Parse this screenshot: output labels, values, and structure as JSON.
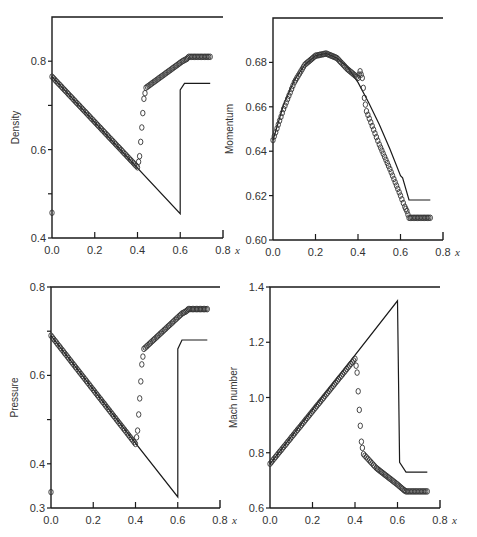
{
  "chart_data": [
    {
      "id": "density",
      "type": "line",
      "title": "",
      "xlabel": "x",
      "ylabel": "Density",
      "xlim": [
        0.0,
        0.8
      ],
      "ylim": [
        0.4,
        0.9
      ],
      "xticks": [
        "0.0",
        "0.2",
        "0.4",
        "0.6",
        "0.8"
      ],
      "yticks": [
        {
          "v": 0.4,
          "label": "0.4"
        },
        {
          "v": 0.5,
          "label": ""
        },
        {
          "v": 0.6,
          "label": "0.6"
        },
        {
          "v": 0.7,
          "label": ""
        },
        {
          "v": 0.8,
          "label": "0.8"
        }
      ],
      "frame": {
        "left": 52,
        "right": 223,
        "top": 17,
        "bottom": 238
      },
      "grid": false,
      "series": [
        {
          "name": "exact",
          "style": "line",
          "x": [
            0.0,
            0.6,
            0.6,
            0.62,
            0.74
          ],
          "y": [
            0.765,
            0.455,
            0.735,
            0.75,
            0.75
          ]
        },
        {
          "name": "numerical",
          "style": "markers",
          "x": [
            0.0,
            0.4,
            0.41,
            0.42,
            0.43,
            0.44,
            0.61,
            0.63,
            0.64,
            0.74
          ],
          "y": [
            0.765,
            0.56,
            0.585,
            0.65,
            0.715,
            0.74,
            0.8,
            0.805,
            0.81,
            0.81
          ],
          "outlier": {
            "x": 0.0,
            "y": 0.457
          }
        }
      ]
    },
    {
      "id": "momentum",
      "type": "line",
      "title": "",
      "xlabel": "x",
      "ylabel": "Momentum",
      "xlim": [
        0.0,
        0.8
      ],
      "ylim": [
        0.6,
        0.7
      ],
      "xticks": [
        "0.0",
        "0.2",
        "0.4",
        "0.6",
        "0.8"
      ],
      "yticks": [
        {
          "v": 0.6,
          "label": "0.60"
        },
        {
          "v": 0.62,
          "label": "0.62"
        },
        {
          "v": 0.64,
          "label": "0.64"
        },
        {
          "v": 0.66,
          "label": "0.66"
        },
        {
          "v": 0.68,
          "label": "0.68"
        }
      ],
      "frame": {
        "left": 273,
        "right": 443,
        "top": 18,
        "bottom": 240
      },
      "grid": false,
      "series": [
        {
          "name": "exact",
          "style": "line",
          "x": [
            0.0,
            0.05,
            0.1,
            0.15,
            0.2,
            0.25,
            0.3,
            0.35,
            0.4,
            0.45,
            0.5,
            0.55,
            0.6,
            0.61,
            0.64,
            0.74
          ],
          "y": [
            0.645,
            0.661,
            0.672,
            0.679,
            0.683,
            0.684,
            0.682,
            0.678,
            0.671,
            0.662,
            0.652,
            0.641,
            0.629,
            0.628,
            0.618,
            0.618
          ]
        },
        {
          "name": "numerical",
          "style": "markers",
          "x": [
            0.0,
            0.05,
            0.1,
            0.15,
            0.2,
            0.25,
            0.3,
            0.35,
            0.4,
            0.41,
            0.42,
            0.43,
            0.44,
            0.5,
            0.55,
            0.6,
            0.62,
            0.63,
            0.64,
            0.74
          ],
          "y": [
            0.645,
            0.659,
            0.671,
            0.679,
            0.683,
            0.684,
            0.682,
            0.677,
            0.673,
            0.676,
            0.673,
            0.664,
            0.658,
            0.643,
            0.632,
            0.62,
            0.615,
            0.613,
            0.61,
            0.61
          ]
        }
      ]
    },
    {
      "id": "pressure",
      "type": "line",
      "title": "",
      "xlabel": "x",
      "ylabel": "Pressure",
      "xlim": [
        0.0,
        0.8
      ],
      "ylim": [
        0.3,
        0.8
      ],
      "xticks": [
        "0.0",
        "0.2",
        "0.4",
        "0.6",
        "0.8"
      ],
      "yticks": [
        {
          "v": 0.3,
          "label": "0.3"
        },
        {
          "v": 0.4,
          "label": "0.4"
        },
        {
          "v": 0.5,
          "label": ""
        },
        {
          "v": 0.6,
          "label": "0.6"
        },
        {
          "v": 0.7,
          "label": ""
        },
        {
          "v": 0.8,
          "label": "0.8"
        }
      ],
      "frame": {
        "left": 51,
        "right": 220,
        "top": 287,
        "bottom": 508
      },
      "grid": false,
      "series": [
        {
          "name": "exact",
          "style": "line",
          "x": [
            0.0,
            0.6,
            0.6,
            0.62,
            0.74
          ],
          "y": [
            0.69,
            0.325,
            0.66,
            0.68,
            0.68
          ]
        },
        {
          "name": "numerical",
          "style": "markers",
          "x": [
            0.0,
            0.4,
            0.41,
            0.42,
            0.43,
            0.44,
            0.62,
            0.64,
            0.65,
            0.74
          ],
          "y": [
            0.69,
            0.445,
            0.475,
            0.548,
            0.625,
            0.66,
            0.74,
            0.745,
            0.75,
            0.75
          ],
          "outlier": {
            "x": 0.0,
            "y": 0.336
          }
        }
      ]
    },
    {
      "id": "mach",
      "type": "line",
      "title": "",
      "xlabel": "x",
      "ylabel": "Mach number",
      "xlim": [
        0.0,
        0.8
      ],
      "ylim": [
        0.6,
        1.4
      ],
      "xticks": [
        "0.0",
        "0.2",
        "0.4",
        "0.6",
        "0.8"
      ],
      "yticks": [
        {
          "v": 0.6,
          "label": "0.6"
        },
        {
          "v": 0.8,
          "label": "0.8"
        },
        {
          "v": 1.0,
          "label": "1.0"
        },
        {
          "v": 1.2,
          "label": "1.2"
        },
        {
          "v": 1.4,
          "label": "1.4"
        }
      ],
      "frame": {
        "left": 270,
        "right": 440,
        "top": 287,
        "bottom": 508
      },
      "grid": false,
      "series": [
        {
          "name": "exact",
          "style": "line",
          "x": [
            0.0,
            0.6,
            0.61,
            0.64,
            0.74
          ],
          "y": [
            0.76,
            1.35,
            0.765,
            0.73,
            0.73
          ]
        },
        {
          "name": "numerical",
          "style": "markers",
          "x": [
            0.0,
            0.4,
            0.41,
            0.42,
            0.43,
            0.44,
            0.5,
            0.55,
            0.6,
            0.63,
            0.64,
            0.74
          ],
          "y": [
            0.76,
            1.14,
            1.09,
            0.955,
            0.84,
            0.795,
            0.745,
            0.715,
            0.685,
            0.665,
            0.66,
            0.66
          ]
        }
      ]
    }
  ],
  "labels": {
    "density": "Density",
    "momentum": "Momentum",
    "pressure": "Pressure",
    "mach": "Mach number",
    "x_var": "x"
  }
}
